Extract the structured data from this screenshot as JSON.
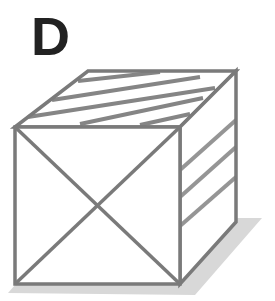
{
  "figure": {
    "label": "D",
    "faces": {
      "top": "diagonal-stripes",
      "front": "x-cross",
      "right": "diagonal-stripes"
    },
    "has_shadow": true
  },
  "colors": {
    "label": "#222222",
    "edge": "#7a7a7a",
    "stripe": "#8c8c8c",
    "shadow": "#d6d6d6",
    "background": "#ffffff"
  }
}
